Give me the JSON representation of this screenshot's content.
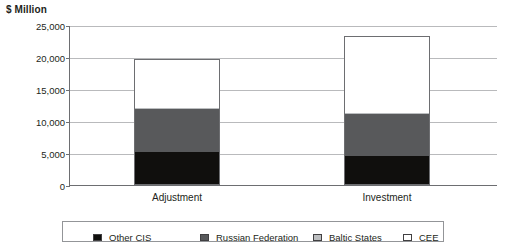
{
  "chart_data": {
    "type": "bar",
    "stacked": true,
    "title": "",
    "ylabel": "$ Million",
    "xlabel": "",
    "ylim": [
      0,
      25000
    ],
    "ytick_labels": [
      "25,000",
      "20,000",
      "15,000",
      "10,000",
      "5,000",
      "0"
    ],
    "ytick_values": [
      25000,
      20000,
      15000,
      10000,
      5000,
      0
    ],
    "grid": true,
    "legend_position": "bottom",
    "categories": [
      "Adjustment",
      "Investment"
    ],
    "series": [
      {
        "name": "Other CIS",
        "color": "#100f0d",
        "values": [
          5000,
          4400
        ]
      },
      {
        "name": "Russian Federation",
        "color": "#58595b",
        "values": [
          6700,
          6500
        ]
      },
      {
        "name": "Baltic States",
        "color": "#bcbec0",
        "values": [
          200,
          250
        ]
      },
      {
        "name": "CEE",
        "color": "#ffffff",
        "values": [
          7500,
          11850
        ]
      }
    ],
    "totals": [
      19400,
      23000
    ]
  },
  "legend": {
    "items": [
      {
        "label": "Other CIS",
        "swatch": "#100f0d"
      },
      {
        "label": "Russian Federation",
        "swatch": "#58595b"
      },
      {
        "label": "Baltic States",
        "swatch": "#bcbec0"
      },
      {
        "label": "CEE",
        "swatch": "#ffffff"
      }
    ]
  }
}
